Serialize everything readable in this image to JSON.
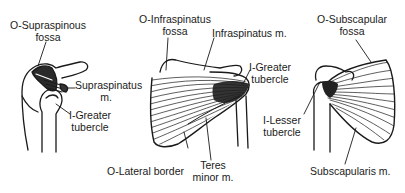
{
  "diagram": {
    "panels": [
      {
        "id": "supraspinatus-view",
        "labels": {
          "origin_line1": "O-Supraspinous",
          "origin_line2": "fossa",
          "muscle_line1": "Supraspinatus",
          "muscle_line2": "m.",
          "insertion_line1": "I-Greater",
          "insertion_line2": "tubercle"
        }
      },
      {
        "id": "infraspinatus-teres-view",
        "labels": {
          "origin_line1": "O-Infraspinatus",
          "origin_line2": "fossa",
          "muscle": "Infraspinatus m.",
          "insertion_line1": "I-Greater",
          "insertion_line2": "tubercle",
          "lateral_border": "O-Lateral border",
          "teres_line1": "Teres",
          "teres_line2": "minor m."
        }
      },
      {
        "id": "subscapularis-view",
        "labels": {
          "origin_line1": "O-Subscapular",
          "origin_line2": "fossa",
          "insertion_line1": "I-Lesser",
          "insertion_line2": "tubercle",
          "muscle": "Subscapularis m."
        }
      }
    ],
    "colors": {
      "ink": "#1a1a1a",
      "background": "#ffffff"
    }
  }
}
